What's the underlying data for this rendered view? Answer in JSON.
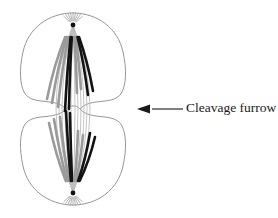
{
  "figure": {
    "background_color": "#ffffff"
  },
  "annotations": [
    {
      "id": "cleavage-furrow",
      "label": "Cleavage furrow",
      "text_x": 186,
      "text_y": 109,
      "leader_line": {
        "x1": 183,
        "y1": 109,
        "x2": 152,
        "y2": 109
      },
      "arrow_tip": {
        "x": 137,
        "y": 109
      },
      "arrow_direction": "left",
      "color": "#1a1a1a"
    }
  ],
  "cell": {
    "outline_color": "#8a8a8a",
    "outline_width": 0.9,
    "fill": "#ffffff",
    "upper_lobe_path": "M 73 13 C 49 13 28 28 23 52 C 19 70 20 84 24 92 C 27 98 33 100 41 101 C 52 102 60 103 65 108 C 69 112 70 112 73 112 C 76 112 77 112 81 108 C 86 103 94 102 105 101 C 113 100 119 98 122 92 C 126 84 127 70 123 52 C 118 28 97 13 73 13 Z",
    "lower_lobe_path": "M 73 205 C 49 205 28 190 23 166 C 19 148 20 134 24 126 C 27 120 33 118 41 117 C 52 116 60 115 65 110 C 69 106 70 106 73 106 C 76 106 77 106 81 110 C 86 115 94 116 105 117 C 113 118 119 120 122 126 C 126 134 127 148 123 166 C 118 190 97 205 73 205 Z"
  },
  "spindle": {
    "poles": [
      {
        "name": "upper-pole",
        "x": 73,
        "y": 25,
        "centrosome_color": "#111111",
        "centrosome_radius": 2.4
      },
      {
        "name": "lower-pole",
        "x": 73,
        "y": 193,
        "centrosome_color": "#111111",
        "centrosome_radius": 2.4
      }
    ],
    "fiber_color": "#b9b9b9",
    "fiber_width": 0.85,
    "aster_color": "#9e9e9e",
    "aster_width": 0.8,
    "aster_ray_count": 9,
    "aster_length": 13,
    "equator_y": 109
  },
  "chromosomes": {
    "dark_color": "#131313",
    "light_color": "#9a9a9a",
    "stroke_width": 2.6,
    "upper_set": [
      {
        "color": "light",
        "x_offset": -26,
        "curve": -16,
        "length": 62
      },
      {
        "color": "light",
        "x_offset": -21,
        "curve": -13,
        "length": 66
      },
      {
        "color": "light",
        "x_offset": -15,
        "curve": -10,
        "length": 70
      },
      {
        "color": "dark",
        "x_offset": -8,
        "curve": -5,
        "length": 74
      },
      {
        "color": "dark",
        "x_offset": -4,
        "curve": -3,
        "length": 72
      },
      {
        "color": "light",
        "x_offset": 4,
        "curve": 3,
        "length": 56
      },
      {
        "color": "light",
        "x_offset": 8,
        "curve": 5,
        "length": 52
      },
      {
        "color": "dark",
        "x_offset": 15,
        "curve": 9,
        "length": 58
      },
      {
        "color": "dark",
        "x_offset": 20,
        "curve": 12,
        "length": 54
      }
    ],
    "lower_set": [
      {
        "color": "light",
        "x_offset": -24,
        "curve": -14,
        "length": 58
      },
      {
        "color": "light",
        "x_offset": -19,
        "curve": -11,
        "length": 62
      },
      {
        "color": "light",
        "x_offset": -13,
        "curve": -8,
        "length": 64
      },
      {
        "color": "dark",
        "x_offset": -7,
        "curve": -4,
        "length": 70
      },
      {
        "color": "dark",
        "x_offset": -3,
        "curve": -2,
        "length": 68
      },
      {
        "color": "light",
        "x_offset": 5,
        "curve": 4,
        "length": 50
      },
      {
        "color": "light",
        "x_offset": 10,
        "curve": 7,
        "length": 46
      },
      {
        "color": "dark",
        "x_offset": 17,
        "curve": 11,
        "length": 48
      },
      {
        "color": "dark",
        "x_offset": 22,
        "curve": 14,
        "length": 44
      }
    ]
  }
}
